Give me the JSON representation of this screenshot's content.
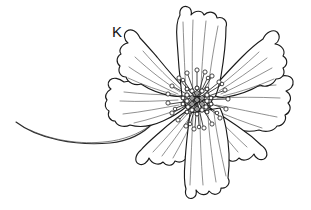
{
  "figure": {
    "label": "K",
    "label_x": 112,
    "label_y": 24,
    "background_color": "#ffffff",
    "ink_color": "#1a1a1a",
    "vein_color": "#555555",
    "canvas": {
      "width": 311,
      "height": 210
    }
  },
  "flower": {
    "center": {
      "x": 197,
      "y": 100
    },
    "petal_count": 8,
    "disc_radius": 21,
    "stamen_count": 26,
    "petals": [
      {
        "name": "petal-top",
        "angle_deg": 88,
        "length": 92
      },
      {
        "name": "petal-upper-left",
        "angle_deg": 140,
        "length": 78
      },
      {
        "name": "petal-upper-right",
        "angle_deg": 35,
        "length": 86
      },
      {
        "name": "petal-left",
        "angle_deg": 182,
        "length": 88
      },
      {
        "name": "petal-right",
        "angle_deg": 352,
        "length": 96
      },
      {
        "name": "petal-lower-left",
        "angle_deg": 218,
        "length": 84
      },
      {
        "name": "petal-bottom",
        "angle_deg": 268,
        "length": 98
      },
      {
        "name": "petal-lower-right",
        "angle_deg": 312,
        "length": 88
      }
    ]
  },
  "stem": {
    "name": "stem",
    "start": {
      "x": 16,
      "y": 122
    },
    "end": {
      "x": 150,
      "y": 118
    },
    "curvature": "concave-up sweeping curve"
  }
}
